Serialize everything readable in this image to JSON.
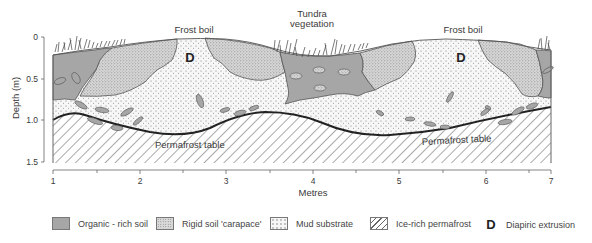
{
  "diagram": {
    "annotations": {
      "frost_boil_left": "Frost boil",
      "frost_boil_right": "Frost boil",
      "tundra_line1": "Tundra",
      "tundra_line2": "vegetation",
      "diapir_left": "D",
      "diapir_right": "D",
      "permafrost_left": "Permafrost table",
      "permafrost_right": "Permafrost table"
    },
    "y_axis": {
      "label": "Depth (m)",
      "ticks": [
        "0",
        "0.5",
        "1.0",
        "1.5"
      ]
    },
    "x_axis": {
      "label": "Metres",
      "ticks": [
        "1",
        "2",
        "3",
        "4",
        "5",
        "6",
        "7"
      ]
    },
    "colors": {
      "organic": "#a6a6a6",
      "carapace": "#d9d9d9",
      "mud": "#f6f6f6",
      "outline": "#555555",
      "permafrost_line": "#222222"
    }
  },
  "legend": {
    "items": [
      {
        "label": "Organic - rich soil",
        "swatch": "organic"
      },
      {
        "label": "Rigid soil 'carapace'",
        "swatch": "carapace"
      },
      {
        "label": "Mud substrate",
        "swatch": "mud"
      },
      {
        "label": "Ice-rich permafrost",
        "swatch": "ice"
      },
      {
        "label": "Diapiric extrusion",
        "symbol": "D"
      }
    ]
  }
}
